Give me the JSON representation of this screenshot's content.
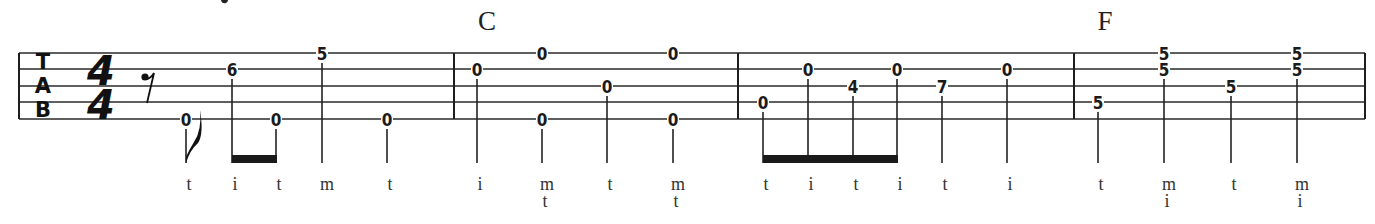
{
  "notation": {
    "type": "banjo-tablature",
    "top_cutoff_glyph": "y",
    "clef": {
      "letters": [
        "T",
        "A",
        "B"
      ]
    },
    "time_signature": {
      "top": "4",
      "bottom": "4"
    },
    "staff": {
      "left_x": 19,
      "right_x": 1365,
      "string_y": [
        53,
        69,
        86,
        102,
        119
      ],
      "string_count": 5
    },
    "barlines_x": [
      454,
      738,
      1074,
      1365
    ],
    "chords": [
      {
        "label": "C",
        "x": 487
      },
      {
        "label": "F",
        "x": 1105
      }
    ],
    "rest": {
      "type": "eighth-rest",
      "x": 147
    },
    "measures": [
      {
        "number": 1,
        "notes": [
          {
            "x": 186,
            "frets": [
              {
                "string": 5,
                "fret": "0"
              }
            ],
            "fingers": [
              "t"
            ],
            "flag": true
          },
          {
            "x": 232,
            "frets": [
              {
                "string": 2,
                "fret": "6"
              }
            ],
            "fingers": [
              "i"
            ]
          },
          {
            "x": 276,
            "frets": [
              {
                "string": 5,
                "fret": "0"
              }
            ],
            "fingers": [
              "t"
            ]
          },
          {
            "x": 322,
            "frets": [
              {
                "string": 1,
                "fret": "5"
              }
            ],
            "fingers": [
              "m"
            ]
          },
          {
            "x": 387,
            "frets": [
              {
                "string": 5,
                "fret": "0"
              }
            ],
            "fingers": [
              "t"
            ]
          }
        ],
        "beams": [
          [
            1,
            2
          ]
        ]
      },
      {
        "number": 2,
        "chord": "C",
        "notes": [
          {
            "x": 477,
            "frets": [
              {
                "string": 2,
                "fret": "0"
              }
            ],
            "fingers": [
              "i"
            ]
          },
          {
            "x": 542,
            "frets": [
              {
                "string": 1,
                "fret": "0"
              },
              {
                "string": 5,
                "fret": "0"
              }
            ],
            "fingers": [
              "m",
              "t"
            ]
          },
          {
            "x": 607,
            "frets": [
              {
                "string": 3,
                "fret": "0"
              }
            ],
            "fingers": [
              "t"
            ]
          },
          {
            "x": 673,
            "frets": [
              {
                "string": 1,
                "fret": "0"
              },
              {
                "string": 5,
                "fret": "0"
              }
            ],
            "fingers": [
              "m",
              "t"
            ]
          }
        ],
        "beams": []
      },
      {
        "number": 3,
        "notes": [
          {
            "x": 763,
            "frets": [
              {
                "string": 4,
                "fret": "0"
              }
            ],
            "fingers": [
              "t"
            ]
          },
          {
            "x": 808,
            "frets": [
              {
                "string": 2,
                "fret": "0"
              }
            ],
            "fingers": [
              "i"
            ]
          },
          {
            "x": 853,
            "frets": [
              {
                "string": 3,
                "fret": "4"
              }
            ],
            "fingers": [
              "t"
            ]
          },
          {
            "x": 897,
            "frets": [
              {
                "string": 2,
                "fret": "0"
              }
            ],
            "fingers": [
              "i"
            ]
          },
          {
            "x": 942,
            "frets": [
              {
                "string": 3,
                "fret": "7"
              }
            ],
            "fingers": [
              "t"
            ]
          },
          {
            "x": 1007,
            "frets": [
              {
                "string": 2,
                "fret": "0"
              }
            ],
            "fingers": [
              "i"
            ]
          }
        ],
        "beams": [
          [
            0,
            3
          ]
        ]
      },
      {
        "number": 4,
        "chord": "F",
        "notes": [
          {
            "x": 1098,
            "frets": [
              {
                "string": 4,
                "fret": "5"
              }
            ],
            "fingers": [
              "t"
            ]
          },
          {
            "x": 1164,
            "frets": [
              {
                "string": 1,
                "fret": "5"
              },
              {
                "string": 2,
                "fret": "5"
              }
            ],
            "fingers": [
              "m",
              "i"
            ]
          },
          {
            "x": 1231,
            "frets": [
              {
                "string": 3,
                "fret": "5"
              }
            ],
            "fingers": [
              "t"
            ]
          },
          {
            "x": 1297,
            "frets": [
              {
                "string": 1,
                "fret": "5"
              },
              {
                "string": 2,
                "fret": "5"
              }
            ],
            "fingers": [
              "m",
              "i"
            ]
          }
        ],
        "beams": []
      }
    ],
    "layout": {
      "stem_bottom_y": 163,
      "beam_top_y": 155,
      "beam_height": 8,
      "finger_row_y": [
        190,
        207
      ],
      "chord_y": 30
    },
    "colors": {
      "ink": "#1a1a1a",
      "background": "#ffffff"
    }
  }
}
